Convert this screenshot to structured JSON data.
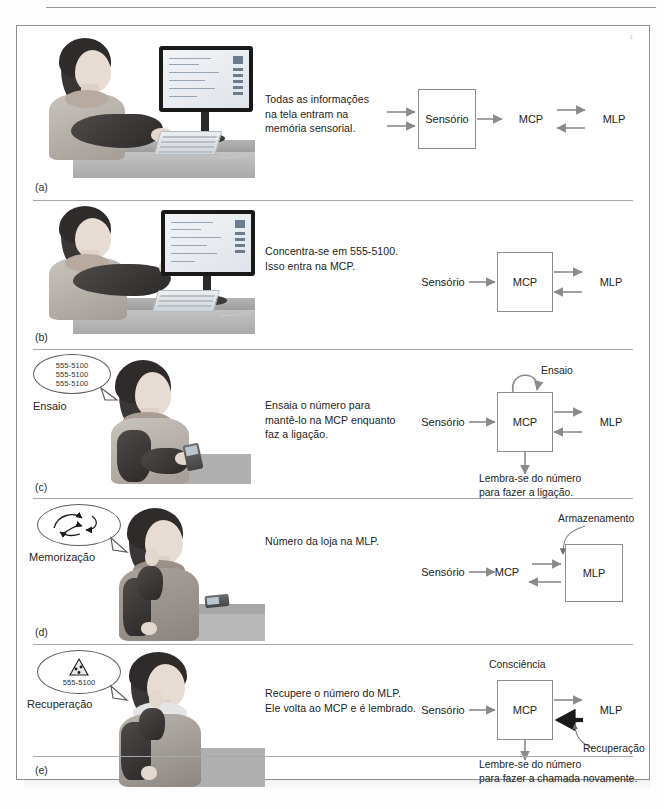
{
  "figure": {
    "title_present": false,
    "corner_mark": "¹",
    "panels": [
      {
        "letter": "(a)",
        "caption": "Todas as informações\nna tela entram na\nmemória sensorial.",
        "caption_lines": [
          "Todas as informações",
          "na tela entram na",
          "memória sensorial."
        ],
        "scene": "woman-typing-at-computer",
        "bubble": null,
        "bubble_label": null,
        "diagram": {
          "nodes": [
            {
              "id": "sensorio",
              "label": "Sensório",
              "boxed": true
            },
            {
              "id": "mcp",
              "label": "MCP",
              "boxed": false
            },
            {
              "id": "mlp",
              "label": "MLP",
              "boxed": false
            }
          ],
          "annotations": [],
          "arrows": [
            "input-double-into-sensorio",
            "sensorio-to-mcp",
            "mcp-to-mlp",
            "mlp-to-mcp"
          ]
        }
      },
      {
        "letter": "(b)",
        "caption": "Concentra-se em 555-5100.\nIsso entra na MCP.",
        "caption_lines": [
          "Concentra-se em 555-5100.",
          "Isso entra na MCP."
        ],
        "scene": "woman-pointing-at-screen",
        "bubble": null,
        "bubble_label": null,
        "diagram": {
          "nodes": [
            {
              "id": "sensorio",
              "label": "Sensório",
              "boxed": false
            },
            {
              "id": "mcp",
              "label": "MCP",
              "boxed": true
            },
            {
              "id": "mlp",
              "label": "MLP",
              "boxed": false
            }
          ],
          "annotations": [],
          "arrows": [
            "sensorio-to-mcp",
            "mcp-to-mlp",
            "mlp-to-mcp"
          ]
        }
      },
      {
        "letter": "(c)",
        "caption": "Ensaia o número para\nmantê-lo na MCP enquanto\nfaz a ligação.",
        "caption_lines": [
          "Ensaia o número para",
          "mantê-lo na MCP enquanto",
          "faz a ligação."
        ],
        "scene": "woman-dialing-phone",
        "bubble": [
          "555-5100",
          "555-5100",
          "555-5100"
        ],
        "bubble_label": "Ensaio",
        "diagram": {
          "nodes": [
            {
              "id": "sensorio",
              "label": "Sensório",
              "boxed": false
            },
            {
              "id": "mcp",
              "label": "MCP",
              "boxed": true
            },
            {
              "id": "mlp",
              "label": "MLP",
              "boxed": false
            }
          ],
          "annotations": [
            {
              "id": "ensaio",
              "label": "Ensaio",
              "kind": "self-loop-top"
            },
            {
              "id": "lembra",
              "label": "Lembra-se do número\npara fazer a ligação.",
              "lines": [
                "Lembra-se do número",
                "para fazer a ligação."
              ],
              "kind": "arrow-down-caption"
            }
          ],
          "arrows": [
            "sensorio-to-mcp",
            "mcp-to-mlp",
            "mlp-to-mcp",
            "mcp-loop",
            "mcp-down"
          ]
        }
      },
      {
        "letter": "(d)",
        "caption": "Número da loja na MLP.",
        "caption_lines": [
          "Número da loja na MLP."
        ],
        "scene": "woman-thinking-phone-on-desk",
        "bubble": [
          "swirl-arrows"
        ],
        "bubble_label": "Memorização",
        "diagram": {
          "nodes": [
            {
              "id": "sensorio",
              "label": "Sensório",
              "boxed": false
            },
            {
              "id": "mcp",
              "label": "MCP",
              "boxed": false
            },
            {
              "id": "mlp",
              "label": "MLP",
              "boxed": true
            }
          ],
          "annotations": [
            {
              "id": "armazenamento",
              "label": "Armazenamento",
              "kind": "curved-pointer-down"
            }
          ],
          "arrows": [
            "sensorio-to-mcp",
            "mcp-to-mlp",
            "mlp-to-mcp",
            "armazenamento-curve"
          ]
        }
      },
      {
        "letter": "(e)",
        "caption": "Recupere o número do MLP.\nEle volta ao MCP e é lembrado.",
        "caption_lines": [
          "Recupere o número do MLP.",
          "Ele volta ao MCP e é lembrado."
        ],
        "scene": "woman-on-phone-call",
        "bubble": [
          "pizza-slice-icon",
          "555-5100"
        ],
        "bubble_label": "Recuperação",
        "diagram": {
          "nodes": [
            {
              "id": "sensorio",
              "label": "Sensório",
              "boxed": false
            },
            {
              "id": "mcp",
              "label": "MCP",
              "boxed": true
            },
            {
              "id": "mlp",
              "label": "MLP",
              "boxed": false
            }
          ],
          "annotations": [
            {
              "id": "consciencia",
              "label": "Consciência",
              "kind": "label-above-box"
            },
            {
              "id": "recuperacao",
              "label": "Recuperação",
              "kind": "curved-pointer-up"
            },
            {
              "id": "lembre",
              "label": "Lembre-se do número\npara fazer a chamada novamente.",
              "lines": [
                "Lembre-se do número",
                "para fazer a chamada novamente."
              ],
              "kind": "arrow-down-caption"
            }
          ],
          "arrows": [
            "sensorio-to-mcp",
            "mcp-to-mlp",
            "mlp-to-mcp-bold",
            "mcp-down",
            "recuperacao-curve"
          ]
        }
      }
    ]
  },
  "colors": {
    "frame_border": "#8d8d8d",
    "rule": "#a8a8a8",
    "node_border": "#8c8c8c",
    "arrow_gray": "#8a8a8a",
    "arrow_bold": "#1a1a1a",
    "text": "#232323",
    "page_bg": "#ffffff"
  }
}
